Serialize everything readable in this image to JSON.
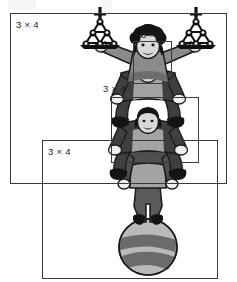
{
  "figure": {
    "label_text": "3 × 4",
    "boxes": [
      {
        "id": "outer-frame",
        "label": "3 × 4",
        "x": 10,
        "y": 13,
        "w": 217,
        "h": 171,
        "label_x": 16,
        "label_y": 19
      },
      {
        "id": "head-frame",
        "label": "3 × 4",
        "x": 133,
        "y": 41,
        "w": 39,
        "h": 43,
        "label_x": 141,
        "label_y": 29
      },
      {
        "id": "middle-frame",
        "label": "3 × 4",
        "x": 111,
        "y": 97,
        "w": 88,
        "h": 66,
        "label_x": 103,
        "label_y": 83
      },
      {
        "id": "base-frame",
        "label": "3 × 4",
        "x": 42,
        "y": 140,
        "w": 176,
        "h": 139,
        "label_x": 48,
        "label_y": 146
      }
    ],
    "colors": {
      "line": "#3a3a3a",
      "text": "#1c1c1c",
      "background": "#ffffff",
      "ink_dark": "#1a1a1a",
      "costume_dark": "#4f4f4f",
      "costume_mid": "#6e6e6e",
      "costume_light": "#a8a8a8",
      "skin": "#d9d9d9",
      "highlight": "#f2f2f2",
      "ball_light": "#b9b9b9",
      "ball_stripe": "#6b6b6b"
    },
    "illustration": {
      "name": "acrobat-stack",
      "acrobats": 3,
      "props": [
        "ball",
        "left-ball-pyramid",
        "right-ball-pyramid"
      ],
      "pyramid_rows": [
        1,
        2,
        3
      ],
      "description": "Top acrobat balances a ball-pyramid prop on each outstretched hand; two acrobats below, lowest stands on a large striped ball."
    }
  }
}
